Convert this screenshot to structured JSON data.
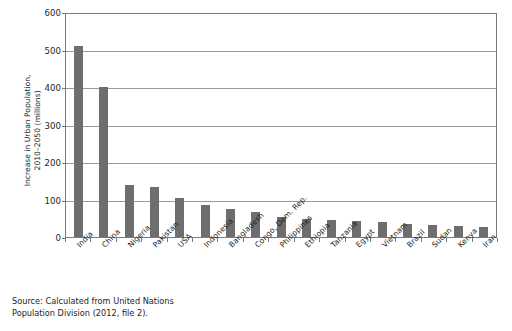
{
  "figure": {
    "title_remnant": "",
    "source_note": "Source: Calculated from United Nations\nPopulation Division (2012, file 2).",
    "bar_color": "#6e6e6e",
    "grid_color": "#9a9a9a",
    "axis_color": "#7a7a7a"
  },
  "chart_data": {
    "type": "bar",
    "title": "",
    "xlabel": "",
    "ylabel": "Increase in Urban Population,\n2010–2050 (millions)",
    "ylim": [
      0,
      600
    ],
    "ytick_values": [
      0,
      100,
      200,
      300,
      400,
      500,
      600
    ],
    "ytick_labels": [
      "0",
      "100",
      "200",
      "300",
      "400",
      "500",
      "600"
    ],
    "grid": true,
    "legend": false,
    "categories": [
      "India",
      "China",
      "Nigeria",
      "Pakistan",
      "USA",
      "Indonesia",
      "Bangladesh",
      "Congo, Dem. Rep.",
      "Philippines",
      "Ethiopia",
      "Tanzania",
      "Egypt",
      "Vietnam",
      "Brazil",
      "Sudan",
      "Kenya",
      "Iran"
    ],
    "values": [
      510,
      400,
      140,
      133,
      104,
      86,
      75,
      68,
      54,
      48,
      46,
      44,
      39,
      35,
      33,
      29,
      27
    ]
  }
}
